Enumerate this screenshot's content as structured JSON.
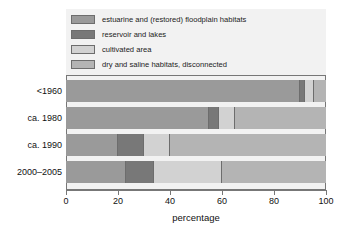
{
  "chart_data": {
    "type": "bar",
    "orientation": "horizontal",
    "stacked": true,
    "normalized": true,
    "title": "",
    "xlabel": "percentage",
    "ylabel": "",
    "xlim": [
      0,
      100
    ],
    "xticks": [
      0,
      20,
      40,
      60,
      80,
      100
    ],
    "xticklabels": [
      "0",
      "20",
      "40",
      "60",
      "80",
      "100"
    ],
    "grid": false,
    "legend_position": "top-inside",
    "categories": [
      "<1960",
      "ca. 1980",
      "ca. 1990",
      "2000–2005"
    ],
    "series": [
      {
        "name": "estuarine and (restored) floodplain habitats",
        "color": "#9a9a9a",
        "values": [
          90,
          55,
          20,
          23
        ]
      },
      {
        "name": "reservoir and lakes",
        "color": "#787878",
        "values": [
          2,
          4,
          10,
          11
        ]
      },
      {
        "name": "cultivated area",
        "color": "#d2d2d2",
        "values": [
          3.5,
          6,
          10,
          26
        ]
      },
      {
        "name": "dry and saline habitats, disconnected",
        "color": "#b4b4b4",
        "values": [
          4.5,
          35,
          60,
          40
        ]
      }
    ]
  },
  "legend": {
    "items": [
      {
        "label": "estuarine and (restored) floodplain habitats",
        "color": "#9a9a9a"
      },
      {
        "label": "reservoir and lakes",
        "color": "#787878"
      },
      {
        "label": "cultivated area",
        "color": "#d2d2d2"
      },
      {
        "label": "dry and saline habitats, disconnected",
        "color": "#b4b4b4"
      }
    ]
  },
  "axis": {
    "x_title": "percentage",
    "tick_labels": [
      "0",
      "20",
      "40",
      "60",
      "80",
      "100"
    ]
  },
  "category_labels": [
    "<1960",
    "ca. 1980",
    "ca. 1990",
    "2000–2005"
  ],
  "colors": {
    "plot_background": "#f2f2f2",
    "frame": "#777777",
    "segment_border": "#6d6d6d",
    "page_background": "#ffffff",
    "text": "#111111"
  }
}
